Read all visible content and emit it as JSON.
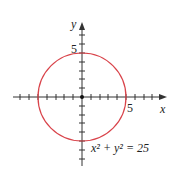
{
  "diagram": {
    "type": "graph",
    "equation_label": "x² + y² = 25",
    "x_axis_label": "x",
    "y_axis_label": "y",
    "x_tick_label": "5",
    "y_tick_label": "5",
    "circle": {
      "center": [
        0,
        0
      ],
      "radius": 5,
      "color": "#d9434a"
    },
    "axis_color": "#333333",
    "x_range": [
      -8,
      8
    ],
    "y_range": [
      -8,
      8
    ]
  }
}
